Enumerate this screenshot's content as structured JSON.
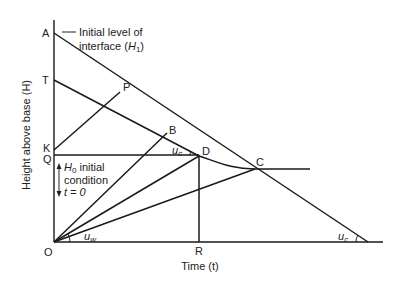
{
  "diagram": {
    "x_axis_label": "Time (t)",
    "y_axis_label": "Height above base (H)",
    "points": {
      "A": "A",
      "T": "T",
      "K": "K",
      "Q": "Q",
      "O": "O",
      "P": "P",
      "B": "B",
      "D": "D",
      "C": "C",
      "R": "R"
    },
    "annotations": {
      "initial_level_line1": "Initial level of",
      "initial_level_line2": "interface (",
      "initial_level_var": "H",
      "initial_level_sub": "1",
      "initial_level_close": ")",
      "h0_var": "H",
      "h0_sub": "0",
      "h0_text": " initial",
      "condition": "condition",
      "t_eq_0": "t = 0",
      "uc_angle_upper": "u",
      "uc_sub": "c",
      "uw_angle": "u",
      "uw_sub": "w",
      "uc_angle_lower": "u"
    }
  }
}
